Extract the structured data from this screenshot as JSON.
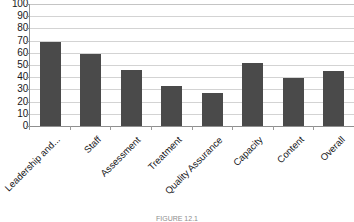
{
  "chart_data": {
    "type": "bar",
    "title": "",
    "xlabel": "",
    "ylabel": "",
    "categories": [
      "Leadership and...",
      "Staff",
      "Assessment",
      "Treatment",
      "Quality Assurance",
      "Capacity",
      "Content",
      "Overall"
    ],
    "values": [
      69,
      59,
      46,
      33,
      27,
      52,
      39,
      45
    ],
    "ylim": [
      0,
      100
    ],
    "ytick_labels": [
      "100",
      "90",
      "80",
      "70",
      "60",
      "50",
      "40",
      "30",
      "20",
      "10",
      "0"
    ],
    "ytick_values": [
      100,
      90,
      80,
      70,
      60,
      50,
      40,
      30,
      20,
      10,
      0
    ],
    "grid": true,
    "legend": false,
    "legend_position": "none",
    "bar_color": "#4a4a4a",
    "gridline_color": "#d3d3d3",
    "axis_color": "#8f8f8f",
    "background_color": "#ffffff"
  },
  "caption": {
    "text": "FIGURE 12.1"
  }
}
